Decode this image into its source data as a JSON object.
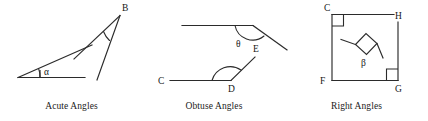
{
  "figure": {
    "stroke_color": "#2b2b2b",
    "background_color": "#ffffff",
    "panel_count": 3
  },
  "panels": [
    {
      "id": "acute",
      "caption": "Acute Angles",
      "angles": [
        {
          "symbol": "α",
          "name": "alpha",
          "type": "acute",
          "vertex": "left-baseline",
          "description": "Small angle between a horizontal baseline ray and an upward-sloping ray"
        },
        {
          "symbol": "",
          "name": "angle-at-B",
          "type": "acute",
          "vertex": "B",
          "description": "Narrow angle at vertex B formed by two rays descending to the lower left"
        }
      ],
      "vertex_labels": [
        "B"
      ]
    },
    {
      "id": "obtuse",
      "caption": "Obtuse Angles",
      "angles": [
        {
          "symbol": "θ",
          "name": "theta",
          "type": "obtuse",
          "vertex": "E",
          "description": "Obtuse angle between a horizontal ray going left and a ray descending to the right"
        },
        {
          "symbol": "",
          "name": "angle-CDE",
          "type": "obtuse",
          "vertex": "D",
          "description": "Obtuse angle at D between ray DC going left and ray DE going up-right"
        }
      ],
      "vertex_labels": [
        "C",
        "D",
        "E"
      ]
    },
    {
      "id": "right",
      "caption": "Right Angles",
      "angles": [
        {
          "symbol": "",
          "name": "angle-at-C",
          "type": "right",
          "vertex": "C",
          "description": "Right angle square at corner C"
        },
        {
          "symbol": "β",
          "name": "beta",
          "type": "right",
          "vertex": "rotated",
          "description": "Rotated right angle square with two rays, labelled beta"
        },
        {
          "symbol": "",
          "name": "angle-at-G",
          "type": "right",
          "vertex": "G",
          "description": "Right angle square at corner G"
        }
      ],
      "vertex_labels": [
        "C",
        "H",
        "F",
        "G"
      ]
    }
  ],
  "labels": {
    "B": "B",
    "C_obtuse": "C",
    "D": "D",
    "E": "E",
    "C_right": "C",
    "H": "H",
    "F": "F",
    "G": "G",
    "alpha": "α",
    "theta": "θ",
    "beta": "β"
  },
  "captions": {
    "acute": "Acute Angles",
    "obtuse": "Obtuse Angles",
    "right": "Right Angles"
  }
}
